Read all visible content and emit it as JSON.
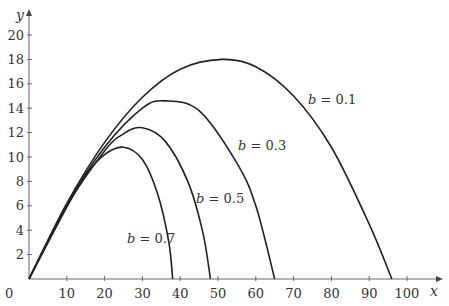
{
  "chart_data": {
    "type": "line",
    "title": "",
    "xlabel": "x",
    "ylabel": "y",
    "xlim": [
      0,
      100
    ],
    "ylim": [
      0,
      20
    ],
    "grid": false,
    "x_ticks": [
      0,
      10,
      20,
      30,
      40,
      50,
      60,
      70,
      80,
      90,
      100
    ],
    "y_ticks": [
      2,
      4,
      6,
      8,
      10,
      12,
      14,
      16,
      18,
      20
    ],
    "series": [
      {
        "name": "b = 0.1",
        "label": "b = 0.1",
        "peak": [
          51,
          18.0
        ],
        "range_end": 96,
        "points": [
          [
            0,
            0
          ],
          [
            10,
            6.2
          ],
          [
            20,
            11.2
          ],
          [
            30,
            14.9
          ],
          [
            40,
            17.2
          ],
          [
            51,
            18.0
          ],
          [
            60,
            17.4
          ],
          [
            70,
            15.0
          ],
          [
            80,
            10.8
          ],
          [
            90,
            4.5
          ],
          [
            96,
            0
          ]
        ]
      },
      {
        "name": "b = 0.3",
        "label": "b = 0.3",
        "peak": [
          36,
          14.6
        ],
        "range_end": 65,
        "points": [
          [
            0,
            0
          ],
          [
            10,
            6.1
          ],
          [
            20,
            10.8
          ],
          [
            30,
            14.0
          ],
          [
            36,
            14.6
          ],
          [
            45,
            13.8
          ],
          [
            55,
            9.5
          ],
          [
            60,
            6.0
          ],
          [
            65,
            0
          ]
        ]
      },
      {
        "name": "b = 0.5",
        "label": "b = 0.5",
        "peak": [
          30,
          12.4
        ],
        "range_end": 48,
        "points": [
          [
            0,
            0
          ],
          [
            10,
            6.0
          ],
          [
            20,
            10.5
          ],
          [
            25,
            11.9
          ],
          [
            30,
            12.4
          ],
          [
            36,
            11.3
          ],
          [
            42,
            8.0
          ],
          [
            46,
            3.8
          ],
          [
            48,
            0
          ]
        ]
      },
      {
        "name": "b = 0.7",
        "label": "b = 0.7",
        "peak": [
          25,
          10.8
        ],
        "range_end": 38,
        "points": [
          [
            0,
            0
          ],
          [
            10,
            5.9
          ],
          [
            15,
            8.5
          ],
          [
            20,
            10.2
          ],
          [
            25,
            10.8
          ],
          [
            30,
            9.8
          ],
          [
            34,
            7.0
          ],
          [
            37,
            3.0
          ],
          [
            38,
            0
          ]
        ]
      }
    ],
    "annotations": [
      "b = 0.1",
      "b = 0.3",
      "b = 0.5",
      "b = 0.7"
    ]
  }
}
